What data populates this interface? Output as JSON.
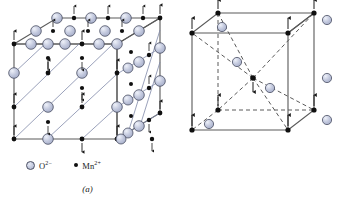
{
  "figure": {
    "type": "crystal-structure-diagram",
    "panels": [
      {
        "id": "a",
        "caption": "(a)",
        "structure": "rock-salt antiferromagnetic lattice (MnO)",
        "legend": [
          {
            "symbol": "anion-circle",
            "label_base": "O",
            "label_sup": "2−",
            "color": "#c3c9de"
          },
          {
            "symbol": "cation-dot",
            "label_base": "Mn",
            "label_sup": "2+",
            "color": "#101010"
          }
        ]
      },
      {
        "id": "b",
        "caption": "(b)",
        "structure": "body-centred tetragonal unit cell (MnF2)",
        "legend": [
          {
            "symbol": "cation-dot",
            "label_base": "Mn",
            "label_sup": "2+",
            "color": "#101010"
          },
          {
            "symbol": "anion-circle",
            "label_base": "F",
            "label_sup": "−",
            "color": "#c3c9de"
          }
        ]
      }
    ],
    "colors": {
      "anion_fill": "#c3c9de",
      "anion_stroke": "#4a4f63",
      "cation_fill": "#101010",
      "cell_edge": "#4d4d4d",
      "dashed_edge": "#555555",
      "background": "#ffffff"
    },
    "spin_arrows": {
      "up_glyph": "↑",
      "down_glyph": "↓",
      "meaning": "magnetic moment direction on Mn2+ sites"
    }
  }
}
